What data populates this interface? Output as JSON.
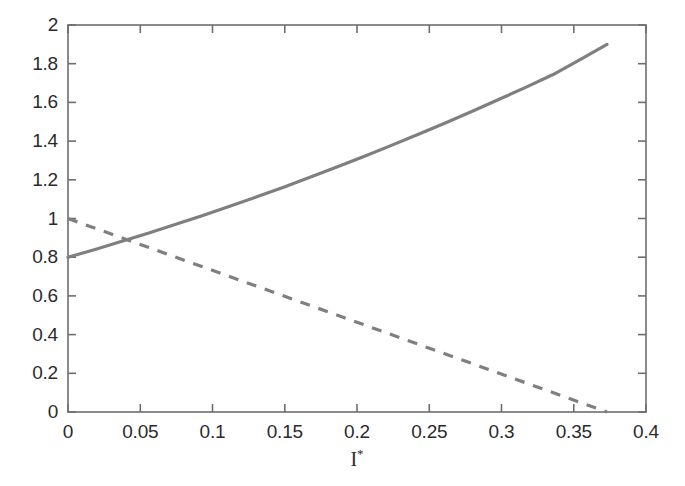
{
  "figure": {
    "background_color": "#ffffff",
    "axis_color": "#6e6e6e",
    "text_color": "#2b2b2b",
    "plot_box": {
      "left": 68,
      "top": 25,
      "right": 646,
      "bottom": 412
    }
  },
  "axis": {
    "x_title_main": "I",
    "x_title_sup": "*",
    "y_title": "",
    "y_ticks": [
      "0",
      "0.2",
      "0.4",
      "0.6",
      "0.8",
      "1",
      "1.2",
      "1.4",
      "1.6",
      "1.8",
      "2"
    ],
    "x_ticks": [
      "0",
      "0.05",
      "0.1",
      "0.15",
      "0.2",
      "0.25",
      "0.3",
      "0.35",
      "0.4"
    ]
  },
  "chart_data": {
    "type": "line",
    "title": "",
    "xlabel": "I*",
    "ylabel": "",
    "xlim": [
      0,
      0.4
    ],
    "ylim": [
      0,
      2
    ],
    "xticks": [
      0,
      0.05,
      0.1,
      0.15,
      0.2,
      0.25,
      0.3,
      0.35,
      0.4
    ],
    "yticks": [
      0,
      0.2,
      0.4,
      0.6,
      0.8,
      1.0,
      1.2,
      1.4,
      1.6,
      1.8,
      2.0
    ],
    "grid": false,
    "legend": "none",
    "line_color": "#7f7f7f",
    "intersection": {
      "x": 0.043,
      "y": 0.885
    },
    "series": [
      {
        "name": "solid-curve",
        "style": "solid",
        "color": "#7f7f7f",
        "width": 3.2,
        "x": [
          0.0,
          0.0187,
          0.0373,
          0.056,
          0.0746,
          0.0933,
          0.1119,
          0.1306,
          0.1492,
          0.1679,
          0.1865,
          0.2052,
          0.2238,
          0.2425,
          0.2611,
          0.2798,
          0.2984,
          0.3171,
          0.3357,
          0.3544,
          0.373
        ],
        "y": [
          0.8,
          0.84,
          0.882,
          0.925,
          0.97,
          1.016,
          1.063,
          1.112,
          1.162,
          1.214,
          1.267,
          1.322,
          1.378,
          1.435,
          1.494,
          1.554,
          1.616,
          1.679,
          1.744,
          1.821,
          1.9
        ]
      },
      {
        "name": "dashed-line",
        "style": "dashed",
        "color": "#7f7f7f",
        "width": 3.2,
        "dash_pattern": [
          10,
          9
        ],
        "x": [
          0.0,
          0.373
        ],
        "y": [
          1.0,
          0.0
        ]
      }
    ]
  }
}
